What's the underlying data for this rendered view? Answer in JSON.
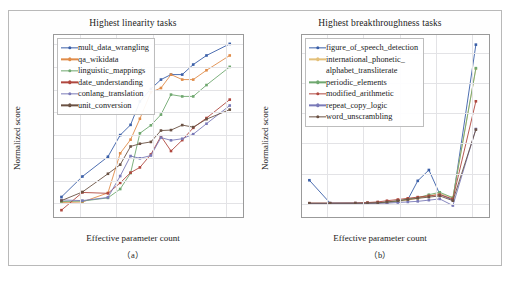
{
  "figure": {
    "panel_a_caption": "（a）",
    "panel_b_caption": "（b）"
  },
  "chart_data": [
    {
      "type": "line",
      "panel": "a",
      "title": "Highest linearity tasks",
      "xlabel": "Effective parameter count",
      "ylabel": "Normalized score",
      "xscale": "log",
      "xlim": [
        2000000,
        300000000000
      ],
      "ylim": [
        -6,
        74
      ],
      "yticks": [
        0,
        10,
        20,
        30,
        40,
        50,
        60,
        70
      ],
      "xticks": [
        10000000,
        100000000,
        1000000000,
        10000000000,
        100000000000
      ],
      "xticklabels": [
        "10^7",
        "10^8",
        "10^9",
        "10^10",
        "10^11"
      ],
      "grid": true,
      "legend_position": "upper left",
      "x": [
        3200000,
        12000000,
        60000000,
        130000000,
        250000000,
        450000000,
        900000000,
        1700000000,
        3200000000,
        6500000000,
        13000000000,
        30000000000,
        130000000000
      ],
      "series": [
        {
          "name": "mult_data_wrangling",
          "color": "#3a5fa8",
          "values": [
            2.8,
            11.8,
            20.5,
            30.0,
            34.5,
            44.8,
            50.3,
            54.4,
            56.6,
            56.6,
            61.0,
            65.0,
            70.1
          ]
        },
        {
          "name": "qa_wikidata",
          "color": "#e08c49",
          "values": [
            0.4,
            0.6,
            4.6,
            22.0,
            28.0,
            37.2,
            48.8,
            50.7,
            56.6,
            54.4,
            54.4,
            58.5,
            65.0
          ]
        },
        {
          "name": "linguistic_mappings",
          "color": "#6fa86f",
          "values": [
            0.8,
            1.0,
            2.4,
            6.3,
            13.3,
            30.8,
            34.3,
            39.0,
            47.8,
            47.0,
            47.0,
            52.0,
            60.0
          ]
        },
        {
          "name": "date_understanding",
          "color": "#b0483f",
          "values": [
            -3.0,
            4.8,
            4.4,
            9.0,
            13.5,
            15.8,
            21.5,
            29.5,
            23.0,
            27.8,
            33.2,
            37.5,
            45.6
          ]
        },
        {
          "name": "conlang_translation",
          "color": "#7a7ab8",
          "values": [
            1.5,
            1.2,
            2.6,
            12.0,
            20.8,
            19.8,
            21.0,
            28.9,
            27.7,
            28.4,
            30.4,
            35.0,
            43.0
          ]
        },
        {
          "name": "unit_conversion",
          "color": "#6b5244",
          "values": [
            1.2,
            5.0,
            13.0,
            17.0,
            25.0,
            26.2,
            27.0,
            32.0,
            32.2,
            34.4,
            33.5,
            37.0,
            41.2
          ]
        }
      ]
    },
    {
      "type": "line",
      "panel": "b",
      "title": "Highest breakthroughness tasks",
      "xlabel": "Effective parameter count",
      "ylabel": "Normalized score",
      "xscale": "log",
      "xlim": [
        2000000,
        300000000000
      ],
      "ylim": [
        -2.2,
        28
      ],
      "yticks": [
        0,
        5,
        10,
        15,
        20,
        25
      ],
      "xticks": [
        10000000,
        100000000,
        1000000000,
        10000000000,
        100000000000
      ],
      "xticklabels": [
        "10^7",
        "10^8",
        "10^9",
        "10^10",
        "10^11"
      ],
      "grid": true,
      "legend_position": "upper left",
      "x": [
        3200000,
        12000000,
        60000000,
        130000000,
        250000000,
        450000000,
        900000000,
        1700000000,
        3200000000,
        6500000000,
        13000000000,
        30000000000,
        130000000000
      ],
      "series": [
        {
          "name": "figure_of_speech_detection",
          "color": "#3a5fa8",
          "values": [
            3.9,
            0.1,
            0.1,
            0.1,
            0.15,
            0.2,
            0.4,
            0.7,
            3.8,
            5.6,
            1.6,
            0.6,
            26.4
          ]
        },
        {
          "name": "international_phonetic_alphabet_transliterate",
          "color": "#e3c07a",
          "values": [
            0.05,
            0.05,
            0.05,
            0.08,
            0.1,
            0.2,
            0.4,
            0.6,
            0.9,
            1.3,
            1.7,
            1.0,
            22.4
          ]
        },
        {
          "name": "periodic_elements",
          "color": "#6fa86f",
          "values": [
            0.05,
            0.05,
            0.05,
            0.1,
            0.15,
            0.25,
            0.45,
            0.8,
            1.0,
            1.5,
            1.9,
            1.0,
            22.5
          ]
        },
        {
          "name": "modified_arithmetic",
          "color": "#b0483f",
          "values": [
            0.1,
            0.1,
            0.12,
            0.2,
            0.3,
            0.5,
            0.7,
            0.9,
            1.1,
            1.3,
            1.5,
            0.8,
            17.0
          ]
        },
        {
          "name": "repeat_copy_logic",
          "color": "#7a7ab8",
          "values": [
            0.05,
            0.05,
            0.05,
            0.05,
            0.08,
            0.1,
            0.2,
            0.3,
            0.4,
            0.6,
            0.8,
            -0.3,
            12.4
          ]
        },
        {
          "name": "word_unscrambling",
          "color": "#6b5244",
          "values": [
            0.08,
            0.08,
            0.08,
            0.1,
            0.15,
            0.3,
            0.5,
            0.7,
            0.9,
            1.1,
            1.3,
            0.5,
            12.3
          ]
        }
      ]
    }
  ],
  "legends": {
    "a": [
      {
        "label": "mult_data_wrangling",
        "color": "#3a5fa8"
      },
      {
        "label": "qa_wikidata",
        "color": "#e08c49"
      },
      {
        "label": "linguistic_mappings",
        "color": "#6fa86f"
      },
      {
        "label": "date_understanding",
        "color": "#b0483f"
      },
      {
        "label": "conlang_translation",
        "color": "#7a7ab8"
      },
      {
        "label": "unit_conversion",
        "color": "#6b5244"
      }
    ],
    "b": [
      {
        "label": "figure_of_speech_detection",
        "color": "#3a5fa8"
      },
      {
        "label": "international_phonetic_",
        "label2": "alphabet_transliterate",
        "color": "#e3c07a"
      },
      {
        "label": "periodic_elements",
        "color": "#6fa86f"
      },
      {
        "label": "modified_arithmetic",
        "color": "#b0483f"
      },
      {
        "label": "repeat_copy_logic",
        "color": "#7a7ab8"
      },
      {
        "label": "word_unscrambling",
        "color": "#6b5244"
      }
    ]
  }
}
